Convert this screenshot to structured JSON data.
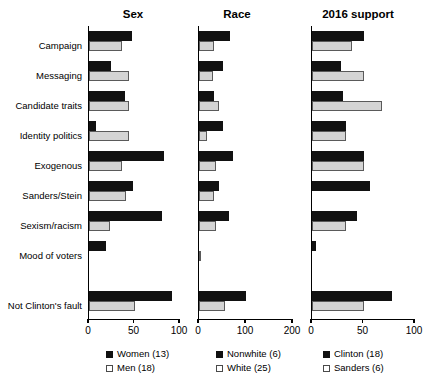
{
  "chart_data": {
    "type": "bar",
    "orientation": "horizontal",
    "title": "",
    "grid": false,
    "legend_position": "bottom",
    "categories": [
      "Campaign",
      "Messaging",
      "Candidate traits",
      "Identity politics",
      "Exogenous",
      "Sanders/Stein",
      "Sexism/racism",
      "Mood of voters",
      "Not Clinton's fault"
    ],
    "panels": [
      {
        "title": "Sex",
        "xlabel": "",
        "ylabel": "",
        "xlim": [
          0,
          100
        ],
        "xticks": [
          0,
          50,
          100
        ],
        "xticklabels": [
          "0",
          "50",
          "100"
        ],
        "series": [
          {
            "name": "Women (13)",
            "color": "#111111",
            "values": [
              47,
              24,
              40,
              8,
              82,
              48,
              80,
              19,
              91
            ]
          },
          {
            "name": "Men (18)",
            "color": "#d4d4d4",
            "values": [
              36,
              44,
              44,
              44,
              36,
              41,
              23,
              0,
              50
            ]
          }
        ]
      },
      {
        "title": "Race",
        "xlabel": "",
        "ylabel": "",
        "xlim": [
          0,
          200
        ],
        "xticks": [
          0,
          100,
          200
        ],
        "xticklabels": [
          "0",
          "100",
          "200"
        ],
        "series": [
          {
            "name": "Nonwhite (6)",
            "color": "#111111",
            "values": [
              67,
              50,
              31,
              50,
              73,
              42,
              64,
              0,
              100
            ]
          },
          {
            "name": "White (25)",
            "color": "#d4d4d4",
            "values": [
              31,
              29,
              42,
              17,
              36,
              32,
              36,
              4,
              56
            ]
          }
        ]
      },
      {
        "title": "2016 support",
        "xlabel": "",
        "ylabel": "",
        "xlim": [
          0,
          100
        ],
        "xticks": [
          0,
          50,
          100
        ],
        "xticklabels": [
          "0",
          "50",
          "100"
        ],
        "series": [
          {
            "name": "Clinton (18)",
            "color": "#111111",
            "values": [
              50,
              28,
              30,
              33,
              50,
              56,
              44,
              4,
              78
            ]
          },
          {
            "name": "Sanders (6)",
            "color": "#d4d4d4",
            "values": [
              39,
              50,
              68,
              33,
              50,
              0,
              33,
              0,
              50
            ]
          }
        ]
      }
    ]
  }
}
